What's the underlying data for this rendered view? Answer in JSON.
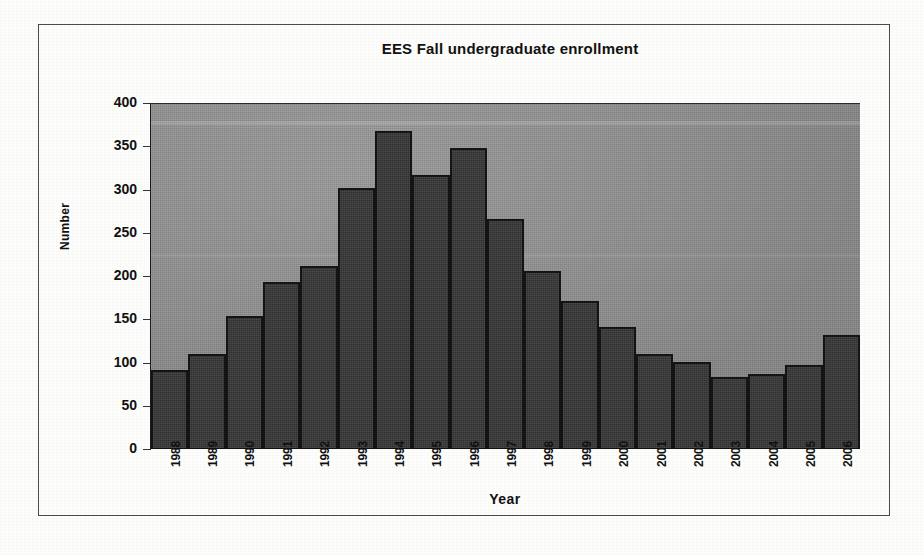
{
  "chart_data": {
    "type": "bar",
    "title": "EES Fall undergraduate enrollment",
    "xlabel": "Year",
    "ylabel": "Number",
    "ylim": [
      0,
      400
    ],
    "ytick_step": 50,
    "yticks": [
      "400",
      "350",
      "300",
      "250",
      "200",
      "150",
      "100",
      "50",
      "0"
    ],
    "grid": false,
    "legend": null,
    "categories": [
      "1988",
      "1989",
      "1990",
      "1991",
      "1992",
      "1993",
      "1994",
      "1995",
      "1996",
      "1997",
      "1998",
      "1999",
      "2000",
      "2001",
      "2002",
      "2003",
      "2004",
      "2005",
      "2006"
    ],
    "values": [
      90,
      109,
      153,
      192,
      210,
      301,
      366,
      316,
      347,
      265,
      205,
      170,
      140,
      109,
      99,
      82,
      85,
      96,
      131
    ],
    "colors": {
      "bar_fill": "#3a3a3a",
      "bar_outline": "#141414",
      "plot_background": "#8e8e8e",
      "text": "#111111",
      "frame_border": "#4a4a4a",
      "page_background": "#fdfdfc"
    }
  }
}
